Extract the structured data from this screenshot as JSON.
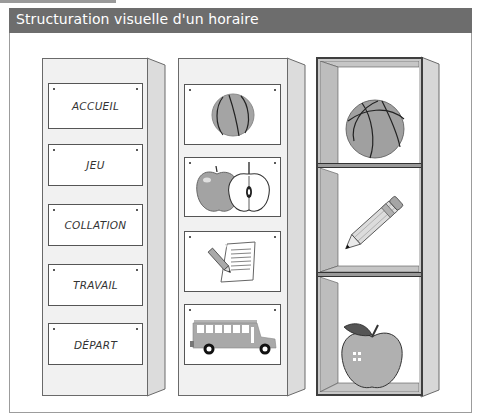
{
  "header": {
    "title": "Structuration visuelle d'un horaire"
  },
  "colors": {
    "header_bg": "#6d6d6d",
    "header_text": "#ffffff",
    "panel_front": "#f1f1f1",
    "panel_side": "#d9d9d9",
    "shelf_frame": "#c8c8c8",
    "illustration_gray": "#a9a9a9"
  },
  "columns": [
    {
      "type": "word-cards",
      "cards": [
        {
          "label": "ACCUEIL"
        },
        {
          "label": "JEU"
        },
        {
          "label": "COLLATION"
        },
        {
          "label": "TRAVAIL"
        },
        {
          "label": "DÉPART"
        }
      ]
    },
    {
      "type": "picture-cards",
      "cards": [
        {
          "icon": "basketball-icon"
        },
        {
          "icon": "apple-halves-icon"
        },
        {
          "icon": "pencil-paper-icon"
        },
        {
          "icon": "school-bus-icon"
        }
      ]
    },
    {
      "type": "object-shelf",
      "compartments": [
        {
          "icon": "basketball-icon"
        },
        {
          "icon": "pencil-icon"
        },
        {
          "icon": "apple-icon"
        }
      ]
    }
  ]
}
